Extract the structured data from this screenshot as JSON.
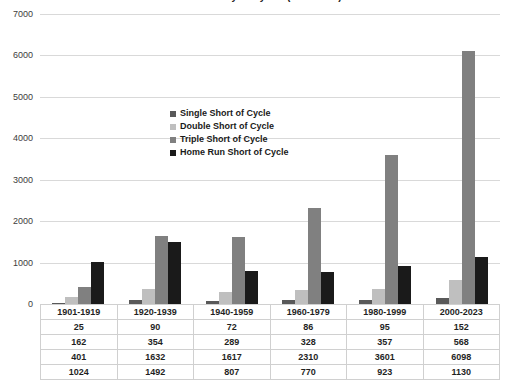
{
  "chart_data": {
    "type": "bar",
    "title": "Short of the Cycle by Era (1901-2023)",
    "xlabel": "",
    "ylabel": "",
    "ylim": [
      0,
      7000
    ],
    "ytick_step": 1000,
    "yticks": [
      "0",
      "1000",
      "2000",
      "3000",
      "4000",
      "5000",
      "6000",
      "7000"
    ],
    "grid": true,
    "legend_position": "center-left-inside",
    "categories": [
      "1901-1919",
      "1920-1939",
      "1940-1959",
      "1960-1979",
      "1980-1999",
      "2000-2023"
    ],
    "series": [
      {
        "name": "Single Short of Cycle",
        "color": "#595959",
        "values": [
          25,
          90,
          72,
          86,
          95,
          152
        ]
      },
      {
        "name": "Double Short of Cycle",
        "color": "#bfbfbf",
        "values": [
          162,
          354,
          289,
          328,
          357,
          568
        ]
      },
      {
        "name": "Triple Short of Cycle",
        "color": "#808080",
        "values": [
          401,
          1632,
          1617,
          2310,
          3601,
          6098
        ]
      },
      {
        "name": "Home Run Short of Cycle",
        "color": "#1a1a1a",
        "values": [
          1024,
          1492,
          807,
          770,
          923,
          1130
        ]
      }
    ]
  },
  "table": {
    "header_row": [
      "1901-1919",
      "1920-1939",
      "1940-1959",
      "1960-1979",
      "1980-1999",
      "2000-2023"
    ],
    "rows": [
      [
        "25",
        "90",
        "72",
        "86",
        "95",
        "152"
      ],
      [
        "162",
        "354",
        "289",
        "328",
        "357",
        "568"
      ],
      [
        "401",
        "1632",
        "1617",
        "2310",
        "3601",
        "6098"
      ],
      [
        "1024",
        "1492",
        "807",
        "770",
        "923",
        "1130"
      ]
    ]
  },
  "colors": {
    "single": "#595959",
    "double": "#bfbfbf",
    "triple": "#808080",
    "homerun": "#1a1a1a",
    "gridline": "#d9d9d9",
    "axis_text": "#3d3d3d",
    "background": "#ffffff"
  }
}
